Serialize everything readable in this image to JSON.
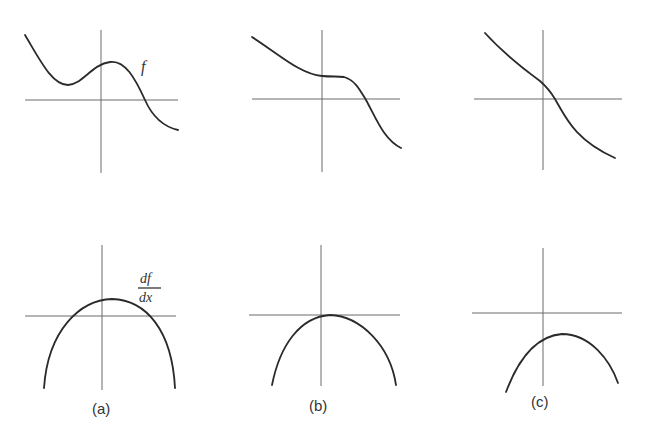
{
  "figure": {
    "panels": [
      {
        "id": "a",
        "caption": "(a)",
        "function_label": "f",
        "derivative_label": {
          "numerator": "df",
          "denominator": "dx"
        },
        "description_top": "f has a local minimum left of origin, local maximum right of origin, then decreases crossing the x-axis",
        "description_bottom": "df/dx is a downward parabola whose peak is above the x-axis (two real roots)"
      },
      {
        "id": "b",
        "caption": "(b)",
        "description_top": "f decreasing with a horizontal inflection (stationary point) just right of origin",
        "description_bottom": "df/dx is a downward parabola touching the x-axis at its peak"
      },
      {
        "id": "c",
        "caption": "(c)",
        "description_top": "f monotonically decreasing through the origin region",
        "description_bottom": "df/dx is a downward parabola entirely below the x-axis"
      }
    ]
  }
}
